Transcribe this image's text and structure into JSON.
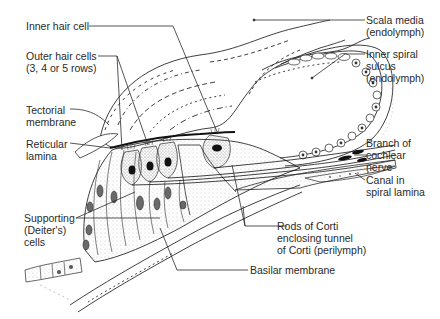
{
  "diagram": {
    "colors": {
      "ink": "#2a2a2a",
      "background": "#ffffff",
      "stipple": "#8a8a8a",
      "nucleus": "#111111"
    },
    "labels": {
      "inner_hair_cell": [
        "Inner hair cell"
      ],
      "outer_hair_cells": [
        "Outer hair cells",
        "(3, 4 or 5 rows)"
      ],
      "tectorial_membrane": [
        "Tectorial",
        "membrane"
      ],
      "reticular_lamina": [
        "Reticular",
        "lamina"
      ],
      "supporting_cells": [
        "Supporting",
        "(Deiter's)",
        "cells"
      ],
      "scala_media": [
        "Scala media",
        "(endolymph)"
      ],
      "inner_spiral_sulcus": [
        "Inner spiral",
        "sulcus",
        "(endolymph)"
      ],
      "cochlear_nerve_branch": [
        "Branch of",
        "cochlear",
        "nerve"
      ],
      "canal_spiral_lamina": [
        "Canal in",
        "spiral lamina"
      ],
      "rods_of_corti": [
        "Rods of Corti",
        "enclosing tunnel",
        "of Corti (perilymph)"
      ],
      "basilar_membrane": [
        "Basilar membrane"
      ]
    }
  }
}
